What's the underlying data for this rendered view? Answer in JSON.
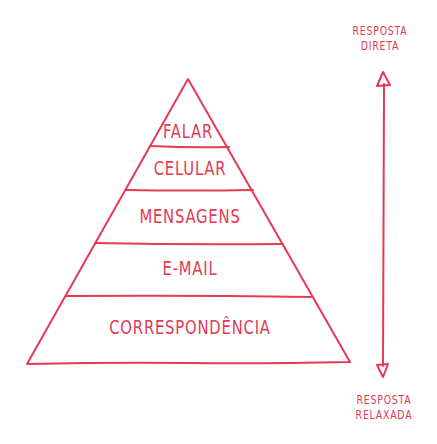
{
  "colors": {
    "stroke": "#e53a53",
    "text": "#e33a52",
    "background": "#ffffff"
  },
  "pyramid": {
    "levels": [
      {
        "label": "FALAR"
      },
      {
        "label": "CELULAR"
      },
      {
        "label": "MENSAGENS"
      },
      {
        "label": "E-MAIL"
      },
      {
        "label": "CORRESPONDÊNCIA"
      }
    ]
  },
  "axis": {
    "top_label_line1": "RESPOSTA",
    "top_label_line2": "DIRETA",
    "bottom_label_line1": "RESPOSTA",
    "bottom_label_line2": "RELAXADA"
  }
}
